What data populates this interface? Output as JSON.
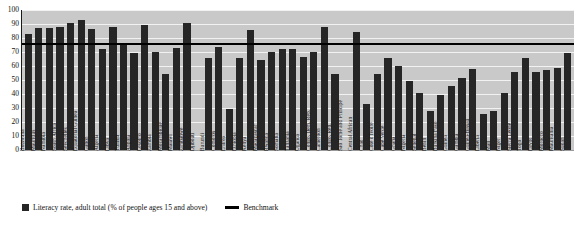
{
  "chart_data": {
    "type": "bar",
    "title": "",
    "subtitle": "",
    "xlabel": "",
    "ylabel": "",
    "ylim": [
      0,
      100
    ],
    "yticks": [
      0,
      10,
      20,
      30,
      40,
      50,
      60,
      70,
      80,
      90,
      100
    ],
    "grid": true,
    "legend_position": "bottom-left",
    "benchmark": 76,
    "plot_background": "#c9c9c9",
    "bar_color": "#262626",
    "benchmark_color": "#000000",
    "categories": [
      "Botswana",
      "Mauritius",
      "Namibia",
      "South Africa",
      "Seychelles",
      "Equatorial Guinea",
      "Gabon",
      "Algeria",
      "Libya",
      "Tunisia",
      "Angola",
      "Lesotho",
      "Zambia",
      "Mozambique",
      "Malawi",
      "Zimbabwe",
      "Djibouti",
      "Burundi",
      "Comoros",
      "Eritrea",
      "Ethiopia",
      "Kenya",
      "Madagascar",
      "Rwanda",
      "Somalia",
      "Tanzania",
      "Uganda",
      "Congo, Dem. Rep.",
      "Cameroon",
      "Congo, Rep.",
      "Sao Tome and Principe",
      "Central African",
      "Chad",
      "Côte d'Ivoire",
      "Cape Verde",
      "Ghana",
      "Nigeria",
      "Senegal",
      "Benin",
      "Burkina Faso",
      "Guinea",
      "Gambia",
      "Guinea-Bissau",
      "Liberia",
      "Mali",
      "Niger",
      "Sierra Leone",
      "Togo",
      "Egypt",
      "Morocco",
      "Mauritania",
      "Sudan"
    ],
    "series": [
      {
        "name": "Literacy rate, adult total (% of people ages 15 and above)",
        "values": [
          83,
          87,
          87.5,
          88,
          91,
          93,
          86.5,
          72,
          88,
          75.5,
          69,
          89,
          70,
          54.5,
          73,
          91,
          null,
          66,
          73.5,
          29,
          66,
          86,
          64,
          70,
          72,
          72.5,
          66.5,
          70,
          88,
          54.5,
          null,
          84.5,
          33,
          54.5,
          66,
          60,
          49,
          41,
          28,
          39,
          46,
          51.5,
          58,
          26,
          28,
          40.5,
          56,
          65.5,
          55.5,
          57,
          58.5,
          69
        ]
      }
    ],
    "benchmark_series": {
      "name": "Benchmark",
      "value": 76
    }
  },
  "legend": {
    "entries": [
      {
        "label": "Literacy rate, adult total (% of people ages 15 and above)",
        "marker": "square-swatch"
      },
      {
        "label": "Benchmark",
        "marker": "line-swatch"
      }
    ]
  }
}
